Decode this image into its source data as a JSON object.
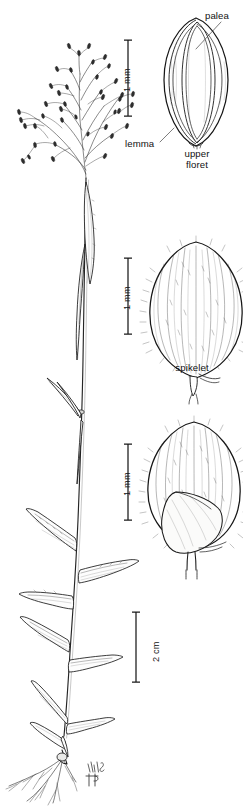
{
  "plate": {
    "kind": "botanical-illustration",
    "subject": "grass (Poaceae) — habit with open panicle, plus spikelet and floret details",
    "background_color": "#ffffff",
    "ink_color": "#1a1a1a",
    "width": 243,
    "height": 811
  },
  "labels": {
    "palea": "palea",
    "lemma": "lemma",
    "upper_floret_line1": "upper",
    "upper_floret_line2": "floret",
    "spikelet": "spikelet"
  },
  "scale_bars": [
    {
      "id": "scale-upper-floret",
      "label": "1 mm",
      "orientation": "vertical",
      "x": 128,
      "y_top": 40,
      "y_bottom": 116
    },
    {
      "id": "scale-spikelet",
      "label": "1 mm",
      "orientation": "vertical",
      "x": 128,
      "y_top": 258,
      "y_bottom": 334
    },
    {
      "id": "scale-lower-spikelet",
      "label": "1 mm",
      "orientation": "vertical",
      "x": 128,
      "y_top": 444,
      "y_bottom": 520
    },
    {
      "id": "scale-habit",
      "label": "2 cm",
      "orientation": "vertical",
      "x": 136,
      "y_top": 612,
      "y_bottom": 682
    }
  ],
  "figures": [
    {
      "id": "habit",
      "name": "whole-plant-habit",
      "caption": "",
      "region": "left column, full height"
    },
    {
      "id": "upper-floret",
      "name": "upper-floret-detail",
      "caption": "upper floret",
      "region": "top right"
    },
    {
      "id": "spikelet",
      "name": "spikelet-detail",
      "caption": "spikelet",
      "region": "middle right"
    },
    {
      "id": "lower-spikelet",
      "name": "spikelet-glume-view",
      "caption": "",
      "region": "lower right"
    }
  ],
  "signature": {
    "text": "MV&HP",
    "description": "artist monogram"
  }
}
